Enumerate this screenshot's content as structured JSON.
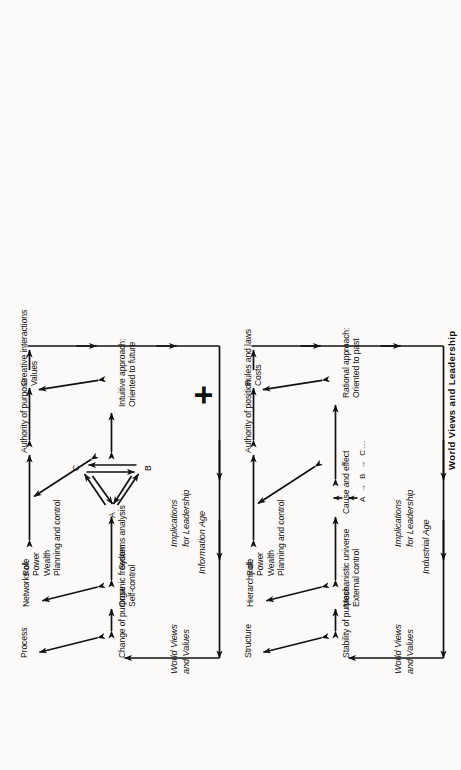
{
  "figure": {
    "title": "World Views and Leadership",
    "plus_symbol": "+"
  },
  "sections": [
    {
      "id": "industrial",
      "era_label": "Industrial Age",
      "column_headers": {
        "world_views": "World Views\nand Values",
        "implications": "Implications\nfor Leadership"
      },
      "rows": [
        {
          "world_view": "Stability of purpose",
          "implication": "Structure"
        },
        {
          "world_view": "Mechanistic universe\nExternal control",
          "implication": "Hierarchy of:",
          "implication_items": "Role\nPower\nWealth\nPlanning and control"
        },
        {
          "world_view": "Cause and effect",
          "world_view_detail": "A → B → C…",
          "implication": "Authority of position"
        },
        {
          "world_view": "Rational approach:\nOriented to past",
          "implication": "Rules and laws\nCosts"
        }
      ]
    },
    {
      "id": "information",
      "era_label": "Information Age",
      "column_headers": {
        "world_views": "World Views\nand Values",
        "implications": "Implications\nfor Leadership"
      },
      "rows": [
        {
          "world_view": "Change of purpose",
          "implication": "Process"
        },
        {
          "world_view": "Organic freedom\nSelf-control",
          "implication": "Networks of:",
          "implication_items": "Role\nPower\nWealth\nPlanning and control"
        },
        {
          "world_view": "Systems analysis",
          "world_view_detail_nodes": [
            "A",
            "B",
            "C"
          ],
          "implication": "Authority of purpose"
        },
        {
          "world_view": "Intuitive approach:\nOriented to future",
          "implication": "Creative interactions\nValues"
        }
      ]
    }
  ],
  "colors": {
    "ink": "#111111",
    "paper": "#fbfaf8"
  }
}
